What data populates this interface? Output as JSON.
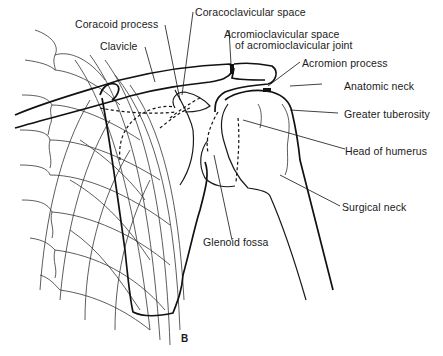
{
  "figure": {
    "panel_label": "B"
  },
  "labels": {
    "coracoid_process": "Coracoid process",
    "coracoclavicular_space": "Coracoclavicular space",
    "clavicle": "Clavicle",
    "acromioclavicular_space_line1": "Acromioclavicular space",
    "acromioclavicular_space_line2": "of acromioclavicular joint",
    "acromion_process": "Acromion process",
    "anatomic_neck": "Anatomic neck",
    "greater_tuberosity": "Greater tuberosity",
    "head_of_humerus": "Head of humerus",
    "surgical_neck": "Surgical neck",
    "glenoid_fossa": "Glenoid fossa"
  }
}
